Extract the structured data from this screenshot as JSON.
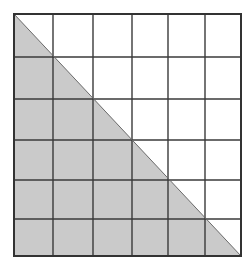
{
  "diagram": {
    "grid": {
      "rows": 6,
      "cols": 6,
      "x_lines": [
        14,
        53,
        93,
        132,
        168,
        205,
        241
      ],
      "y_lines": [
        14,
        57,
        99,
        140,
        180,
        219,
        256
      ]
    },
    "shaded_region": {
      "shape": "triangle",
      "description": "Region below the diagonal from top-left corner to bottom-right corner",
      "points": [
        [
          14,
          14
        ],
        [
          14,
          256
        ],
        [
          241,
          256
        ]
      ]
    },
    "diagonal": {
      "from": [
        14,
        14
      ],
      "to": [
        241,
        256
      ]
    },
    "colors": {
      "background": "#ffffff",
      "shade": "#cacaca",
      "grid_line": "#3a3a3a",
      "border": "#333333"
    }
  }
}
